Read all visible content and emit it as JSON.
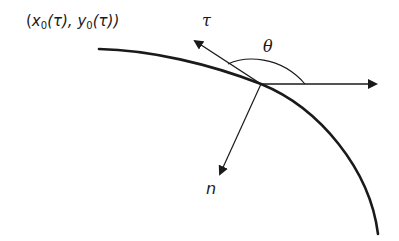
{
  "labels": {
    "point": {
      "open": "(",
      "x": "x",
      "x_sub": "0",
      "x_arg": "(τ), ",
      "y": "y",
      "y_sub": "0",
      "y_arg": "(τ))"
    },
    "tangent": "τ",
    "angle": "θ",
    "normal": "n"
  },
  "colors": {
    "stroke": "#1a1a1a",
    "background": "#ffffff"
  },
  "geometry": {
    "origin": [
      261,
      84
    ],
    "curve_start": [
      99,
      49
    ],
    "curve_end": [
      378,
      234
    ],
    "tangent_tip": [
      193,
      40
    ],
    "horizontal_tip": [
      378,
      84
    ],
    "normal_tip": [
      219,
      176
    ]
  }
}
